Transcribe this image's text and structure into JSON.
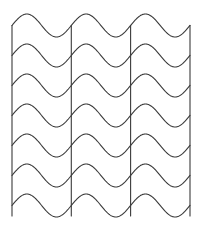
{
  "figure": {
    "kind": "line-art-pattern"
  },
  "canvas": {
    "width": 207,
    "height": 247,
    "background_color": "#ffffff"
  },
  "style": {
    "stroke_color": "#3a3a3a",
    "stroke_width": 1.1,
    "fill": "none",
    "line_cap": "round",
    "line_join": "round"
  },
  "pattern": {
    "wave_row_count": 7,
    "vertical_line_count": 4,
    "cycles_across": 3,
    "wave_period": 59.3,
    "wave_amplitude": 11.5,
    "row_spacing": 30.0,
    "first_row_baseline_y": 25.5,
    "wave_start_x": 12.0,
    "wave_end_x": 190.0,
    "phase": "rise-first",
    "rows_in_phase": true
  },
  "wave_rows": [
    {
      "index": 0,
      "baseline_y": 25.5,
      "label": "wave-row-1"
    },
    {
      "index": 1,
      "baseline_y": 55.5,
      "label": "wave-row-2"
    },
    {
      "index": 2,
      "baseline_y": 85.5,
      "label": "wave-row-3"
    },
    {
      "index": 3,
      "baseline_y": 115.5,
      "label": "wave-row-4"
    },
    {
      "index": 4,
      "baseline_y": 145.5,
      "label": "wave-row-5"
    },
    {
      "index": 5,
      "baseline_y": 175.5,
      "label": "wave-row-6"
    },
    {
      "index": 6,
      "baseline_y": 205.5,
      "label": "wave-row-7"
    }
  ],
  "vertical_lines": [
    {
      "index": 0,
      "x": 12.0,
      "y_top": 25.5,
      "y_bottom": 216.0,
      "label": "vertical-line-left"
    },
    {
      "index": 1,
      "x": 71.3,
      "y_top": 25.5,
      "y_bottom": 216.0,
      "label": "vertical-line-inner-1"
    },
    {
      "index": 2,
      "x": 130.6,
      "y_top": 25.5,
      "y_bottom": 216.0,
      "label": "vertical-line-inner-2"
    },
    {
      "index": 3,
      "x": 190.0,
      "y_top": 25.5,
      "y_bottom": 216.0,
      "label": "vertical-line-right"
    }
  ]
}
